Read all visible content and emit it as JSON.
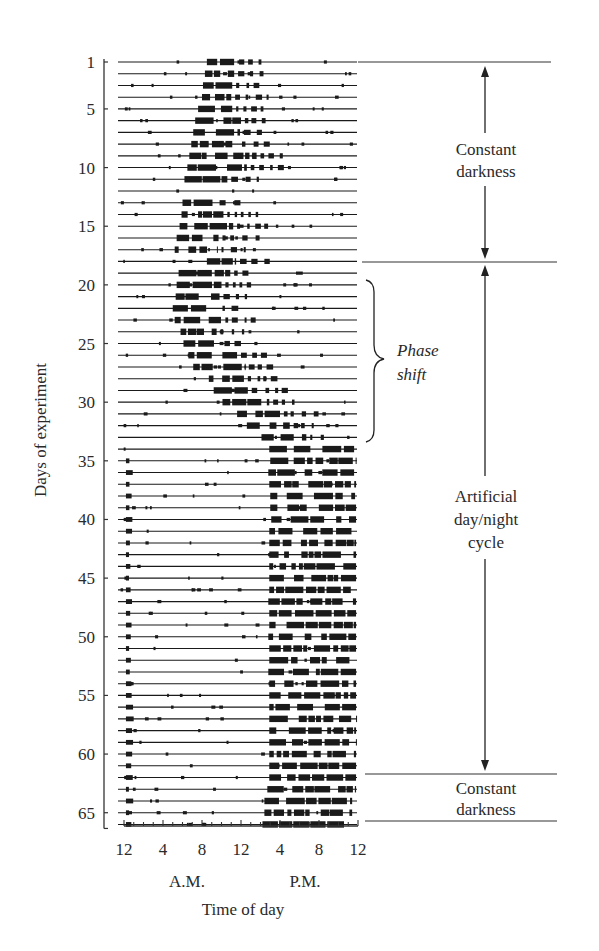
{
  "chart_data": {
    "type": "actogram",
    "title": "",
    "xlabel": "Time of day",
    "ylabel": "Days of experiment",
    "x_ticks": [
      "12",
      "4",
      "8",
      "12",
      "4",
      "8",
      "12"
    ],
    "x_tick_hours": [
      0,
      4,
      8,
      12,
      16,
      20,
      24
    ],
    "x_period_labels": [
      {
        "label": "A.M.",
        "hour": 6
      },
      {
        "label": "P.M.",
        "hour": 18
      }
    ],
    "xlim": [
      0,
      24
    ],
    "y_ticks": [
      1,
      5,
      10,
      15,
      20,
      25,
      30,
      35,
      40,
      45,
      50,
      55,
      60,
      65
    ],
    "ylim": [
      1,
      66
    ],
    "grid": false,
    "annotations": [
      {
        "label": "Constant darkness",
        "day_start": 1,
        "day_end": 18,
        "style": "double-arrow"
      },
      {
        "label": "Artificial day/night cycle",
        "day_start": 18,
        "day_end": 62,
        "style": "double-arrow"
      },
      {
        "label": "Constant darkness",
        "day_start": 62,
        "day_end": 66,
        "style": "band"
      },
      {
        "label": "Phase shift",
        "day_start": 20,
        "day_end": 33,
        "style": "brace",
        "italic": true
      }
    ],
    "series": [
      {
        "name": "activity_onset_hour",
        "description": "Approximate hour of main activity onset for each day (1-66)",
        "values": [
          8.5,
          8.3,
          8.1,
          8.0,
          7.6,
          7.3,
          7.1,
          6.9,
          6.7,
          6.5,
          6.2,
          null,
          6.0,
          5.9,
          5.7,
          5.4,
          5.2,
          8.5,
          5.6,
          5.4,
          5.3,
          5.0,
          5.2,
          5.8,
          6.1,
          6.6,
          7.1,
          8.7,
          9.2,
          10.1,
          11.6,
          12.6,
          14.1,
          14.9,
          15.0,
          14.8,
          14.9,
          15.0,
          15.0,
          15.1,
          14.9,
          14.9,
          14.9,
          14.9,
          14.9,
          14.9,
          14.8,
          14.9,
          14.9,
          14.8,
          14.9,
          14.9,
          14.8,
          14.9,
          14.9,
          14.9,
          14.9,
          14.9,
          14.9,
          14.9,
          14.9,
          14.9,
          14.7,
          14.4,
          14.4,
          14.2
        ]
      },
      {
        "name": "activity_offset_hour",
        "description": "Approximate hour of main activity offset for each day (1-66)",
        "values": [
          11.4,
          11.3,
          11.1,
          11.0,
          11.1,
          12.0,
          11.9,
          11.7,
          13.6,
          12.6,
          10.6,
          null,
          9.4,
          10.2,
          11.2,
          9.7,
          9.6,
          11.5,
          10.9,
          10.0,
          9.8,
          9.7,
          10.0,
          9.5,
          9.9,
          11.6,
          12.4,
          12.3,
          12.7,
          14.9,
          16.0,
          17.0,
          18.7,
          23.6,
          23.8,
          23.6,
          23.8,
          23.7,
          23.8,
          23.8,
          23.7,
          23.8,
          23.8,
          23.8,
          23.8,
          23.8,
          23.8,
          23.8,
          23.8,
          23.8,
          23.8,
          23.8,
          23.8,
          23.8,
          23.8,
          23.8,
          23.8,
          23.8,
          23.8,
          23.8,
          23.8,
          23.8,
          23.8,
          23.4,
          23.4,
          23.0
        ]
      }
    ]
  },
  "labels": {
    "ylabel": "Days of experiment",
    "xlabel": "Time of day",
    "am": "A.M.",
    "pm": "P.M.",
    "constant_darkness_1_line1": "Constant",
    "constant_darkness_1_line2": "darkness",
    "artificial_line1": "Artificial",
    "artificial_line2": "day/night",
    "artificial_line3": "cycle",
    "constant_darkness_2_line1": "Constant",
    "constant_darkness_2_line2": "darkness",
    "phase_line1": "Phase",
    "phase_line2": "shift"
  },
  "colors": {
    "ink": "#1a1a1a",
    "axis": "#333333",
    "text": "#2a2a2a",
    "background": "#ffffff"
  }
}
